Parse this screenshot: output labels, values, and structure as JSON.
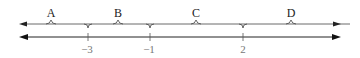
{
  "diagram": {
    "type": "number-line",
    "regions": [
      {
        "label": "A",
        "from": "-inf",
        "to": "-3"
      },
      {
        "label": "B",
        "from": "-3",
        "to": "-1"
      },
      {
        "label": "C",
        "from": "-1",
        "to": "2"
      },
      {
        "label": "D",
        "from": "2",
        "to": "+inf"
      }
    ],
    "ticks": [
      {
        "label": "−3",
        "value": -3
      },
      {
        "label": "−1",
        "value": -1
      },
      {
        "label": "2",
        "value": 2
      }
    ],
    "colors": {
      "line": "#333333",
      "tick_label": "#777777"
    }
  }
}
